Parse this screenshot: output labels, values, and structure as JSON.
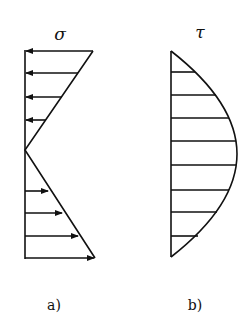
{
  "figure_a": {
    "label": "a)",
    "symbol": "σ",
    "description": "Linear normal stress distribution, compression above neutral axis, tension below"
  },
  "figure_b": {
    "label": "b)",
    "symbol": "τ",
    "description": "Parabolic shear stress distribution"
  },
  "colors": {
    "stroke": "#111111",
    "background": "#ffffff"
  }
}
